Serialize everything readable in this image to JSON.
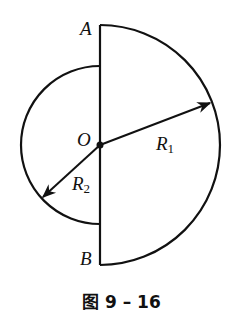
{
  "figure": {
    "labels": {
      "A": "A",
      "B": "B",
      "O": "O",
      "R1_main": "R",
      "R1_sub": "1",
      "R2_main": "R",
      "R2_sub": "2"
    },
    "caption": "图 9 – 16",
    "geometry": {
      "center": [
        100,
        145
      ],
      "R1": 120,
      "R2": 79,
      "stroke_color": "#111111"
    }
  }
}
